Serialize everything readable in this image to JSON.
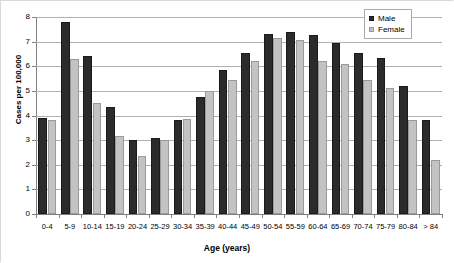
{
  "chart_data": {
    "type": "bar",
    "title": "",
    "xlabel": "Age (years)",
    "ylabel": "Cases per 100,000",
    "ylim": [
      0,
      8
    ],
    "ytick_labels": [
      "8",
      "7",
      "6",
      "5",
      "4",
      "3",
      "2",
      "1",
      "0"
    ],
    "yticks": [
      8,
      7,
      6,
      5,
      4,
      3,
      2,
      1,
      0
    ],
    "grid": true,
    "legend_position": "top-right",
    "categories": [
      "0-4",
      "5-9",
      "10-14",
      "15-19",
      "20-24",
      "25-29",
      "30-34",
      "35-39",
      "40-44",
      "45-49",
      "50-54",
      "55-59",
      "60-64",
      "65-69",
      "70-74",
      "75-79",
      "80-84",
      "> 84"
    ],
    "series": [
      {
        "name": "Male",
        "color": "#2b2b2b",
        "values": [
          3.9,
          7.8,
          6.4,
          4.35,
          3.0,
          3.1,
          3.8,
          4.75,
          5.85,
          6.55,
          7.3,
          7.4,
          7.25,
          6.95,
          6.55,
          6.35,
          5.2,
          3.8
        ]
      },
      {
        "name": "Female",
        "color": "#c3c3c3",
        "values": [
          3.8,
          6.3,
          4.5,
          3.15,
          2.35,
          3.0,
          3.85,
          5.0,
          5.45,
          6.2,
          7.15,
          7.05,
          6.2,
          6.1,
          5.45,
          5.1,
          3.8,
          2.2
        ]
      }
    ]
  },
  "legend": {
    "items": [
      {
        "label": "Male",
        "swatch": "male-swatch"
      },
      {
        "label": "Female",
        "swatch": "female-swatch"
      }
    ]
  },
  "axes": {
    "y_title": "Cases per 100,000",
    "x_title": "Age (years)"
  }
}
